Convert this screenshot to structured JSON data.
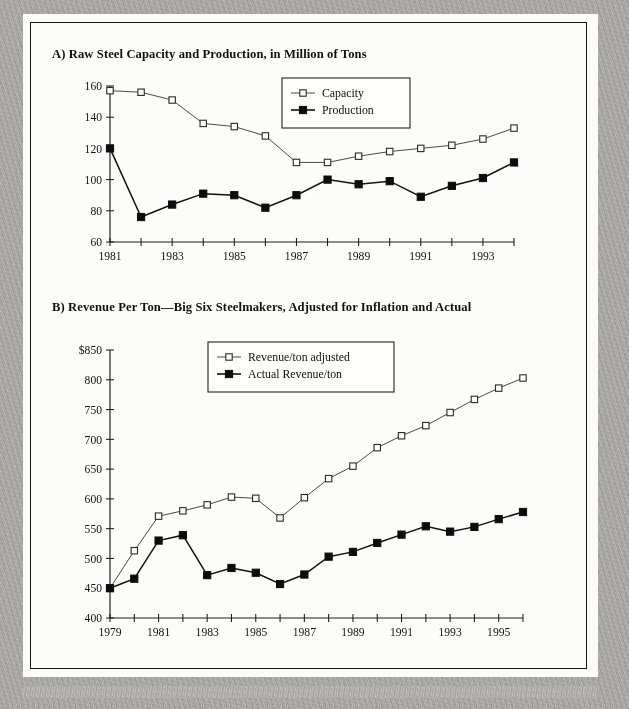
{
  "page": {
    "background_color": "#fbfbf9",
    "border_color": "#b0afac",
    "frame_color": "#181818"
  },
  "charts": {
    "a": {
      "title": "A) Raw Steel Capacity and Production, in Million of Tons",
      "legend": {
        "capacity_label": "Capacity",
        "production_label": "Production"
      }
    },
    "b": {
      "title": "B) Revenue Per Ton—Big Six Steelmakers, Adjusted for Inflation and Actual",
      "legend": {
        "adjusted_label": "Revenue/ton adjusted",
        "actual_label": "Actual Revenue/ton"
      }
    }
  },
  "chart_data": [
    {
      "id": "chart-a",
      "type": "line",
      "title": "A) Raw Steel Capacity and Production, in Million of Tons",
      "xlabel": "",
      "ylabel": "",
      "ylim": [
        60,
        160
      ],
      "xlim": [
        1981,
        1994
      ],
      "yticks": [
        60,
        80,
        100,
        120,
        140,
        160
      ],
      "xticks": [
        1981,
        1982,
        1983,
        1984,
        1985,
        1986,
        1987,
        1988,
        1989,
        1990,
        1991,
        1992,
        1993,
        1994
      ],
      "xtick_labels": [
        "1981",
        "",
        "1983",
        "",
        "1985",
        "",
        "1987",
        "",
        "1989",
        "",
        "1991",
        "",
        "1993",
        ""
      ],
      "grid": false,
      "legend_position": "top-right",
      "x": [
        1981,
        1982,
        1983,
        1984,
        1985,
        1986,
        1987,
        1988,
        1989,
        1990,
        1991,
        1992,
        1993,
        1994
      ],
      "series": [
        {
          "name": "Capacity",
          "marker": "open-square",
          "values": [
            157,
            156,
            151,
            136,
            134,
            128,
            111,
            111,
            115,
            118,
            120,
            122,
            126,
            133
          ]
        },
        {
          "name": "Production",
          "marker": "filled-square",
          "values": [
            120,
            76,
            84,
            91,
            90,
            82,
            90,
            100,
            97,
            99,
            89,
            96,
            101,
            111
          ]
        }
      ]
    },
    {
      "id": "chart-b",
      "type": "line",
      "title": "B) Revenue Per Ton—Big Six Steelmakers, Adjusted for Inflation and Actual",
      "xlabel": "",
      "ylabel": "",
      "ylim": [
        400,
        850
      ],
      "xlim": [
        1979,
        1996
      ],
      "yticks": [
        400,
        450,
        500,
        550,
        600,
        650,
        700,
        750,
        800,
        850
      ],
      "ytick_labels": [
        "400",
        "450",
        "500",
        "550",
        "600",
        "650",
        "700",
        "750",
        "800",
        "$850"
      ],
      "xticks": [
        1979,
        1980,
        1981,
        1982,
        1983,
        1984,
        1985,
        1986,
        1987,
        1988,
        1989,
        1990,
        1991,
        1992,
        1993,
        1994,
        1995,
        1996
      ],
      "xtick_labels": [
        "1979",
        "",
        "1981",
        "",
        "1983",
        "",
        "1985",
        "",
        "1987",
        "",
        "1989",
        "",
        "1991",
        "",
        "1993",
        "",
        "1995",
        ""
      ],
      "grid": false,
      "legend_position": "top-center",
      "x": [
        1979,
        1980,
        1981,
        1982,
        1983,
        1984,
        1985,
        1986,
        1987,
        1988,
        1989,
        1990,
        1991,
        1992,
        1993,
        1994,
        1995,
        1996
      ],
      "series": [
        {
          "name": "Revenue/ton adjusted",
          "marker": "open-square",
          "values": [
            450,
            513,
            571,
            580,
            590,
            603,
            601,
            568,
            602,
            634,
            655,
            686,
            706,
            723,
            745,
            767,
            786,
            803
          ]
        },
        {
          "name": "Actual Revenue/ton",
          "marker": "filled-square",
          "values": [
            450,
            466,
            530,
            539,
            472,
            484,
            476,
            457,
            473,
            503,
            511,
            526,
            540,
            554,
            545,
            553,
            566,
            578
          ]
        }
      ]
    }
  ]
}
